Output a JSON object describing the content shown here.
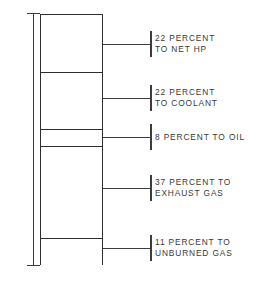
{
  "figure": {
    "axis_caption": "TOTAL ENERGY IN FUEL",
    "ink_color": "#3a3a3a",
    "bar_outline_color": "#2e2e2e",
    "background_color": "#ffffff"
  },
  "chart_data": {
    "type": "bar",
    "title": "",
    "subtitle": "",
    "xlabel": "",
    "ylabel": "TOTAL ENERGY IN FUEL",
    "orientation": "vertical-stacked",
    "units": "percent",
    "total": 100,
    "ylim": [
      0,
      100
    ],
    "grid": false,
    "legend": "none",
    "categories": [
      "NET HP",
      "COOLANT",
      "OIL",
      "EXHAUST GAS",
      "UNBURNED GAS"
    ],
    "values": [
      22,
      22,
      8,
      37,
      11
    ],
    "annotations": [
      "22 PERCENT TO NET HP",
      "22 PERCENT TO COOLANT",
      "8 PERCENT TO OIL",
      "37 PERCENT TO EXHAUST GAS",
      "11 PERCENT TO UNBURNED GAS"
    ]
  },
  "segments": [
    {
      "id": "net-hp",
      "percent": 22,
      "height_px": 58,
      "leader_y": 44,
      "label_top": 33,
      "label_lines": [
        "22 PERCENT",
        "TO NET HP"
      ]
    },
    {
      "id": "coolant",
      "percent": 22,
      "height_px": 57,
      "leader_y": 98,
      "label_top": 87,
      "label_lines": [
        "22 PERCENT",
        "TO COOLANT"
      ]
    },
    {
      "id": "oil",
      "percent": 8,
      "height_px": 17,
      "leader_y": 137,
      "label_top": 132,
      "label_lines": [
        "8 PERCENT TO OIL"
      ]
    },
    {
      "id": "exhaust-gas",
      "percent": 37,
      "height_px": 92,
      "leader_y": 188,
      "label_top": 177,
      "label_lines": [
        "37 PERCENT TO",
        "EXHAUST GAS"
      ]
    },
    {
      "id": "unburned-gas",
      "percent": 11,
      "height_px": 27,
      "leader_y": 248,
      "label_top": 237,
      "label_lines": [
        "11 PERCENT TO",
        "UNBURNED GAS"
      ]
    }
  ]
}
